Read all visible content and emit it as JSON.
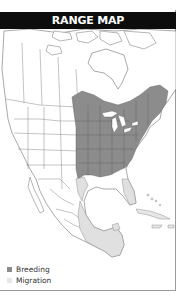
{
  "header": {
    "title": "RANGE MAP"
  },
  "map": {
    "region": "North America",
    "colors": {
      "land": "#ffffff",
      "border": "#6e6e6e",
      "water": "#ffffff",
      "breeding": "#8c8c8c",
      "migration": "#e0e0e0"
    }
  },
  "legend": {
    "items": [
      {
        "label": "Breeding",
        "color": "#8c8c8c"
      },
      {
        "label": "Migration",
        "color": "#e6e6e6"
      }
    ]
  }
}
